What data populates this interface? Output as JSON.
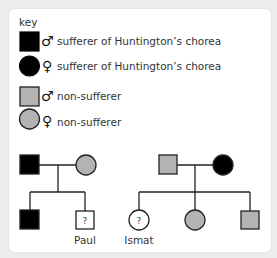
{
  "key": {
    "title": "key",
    "items": [
      {
        "shape": "square",
        "fill": "#000000",
        "sex_symbol": "♂",
        "label": "sufferer of Huntington’s chorea"
      },
      {
        "shape": "circle",
        "fill": "#000000",
        "sex_symbol": "♀",
        "label": "sufferer of Huntington’s chorea"
      },
      {
        "shape": "square",
        "fill": "#b3b3b3",
        "sex_symbol": "♂",
        "label": "non-sufferer"
      },
      {
        "shape": "circle",
        "fill": "#b3b3b3",
        "sex_symbol": "♀",
        "label": "non-sufferer"
      }
    ]
  },
  "colors": {
    "sufferer": "#000000",
    "non_sufferer": "#b3b3b3",
    "unknown": "#ffffff",
    "stroke": "#222222"
  },
  "families": [
    {
      "parents": {
        "father": {
          "status": "sufferer"
        },
        "mother": {
          "status": "non-sufferer"
        }
      },
      "children": [
        {
          "sex": "male",
          "status": "sufferer",
          "name": ""
        },
        {
          "sex": "male",
          "status": "unknown",
          "mark": "?",
          "name": "Paul"
        }
      ]
    },
    {
      "parents": {
        "father": {
          "status": "non-sufferer"
        },
        "mother": {
          "status": "sufferer"
        }
      },
      "children": [
        {
          "sex": "female",
          "status": "unknown",
          "mark": "?",
          "name": "Ismat"
        },
        {
          "sex": "female",
          "status": "non-sufferer",
          "name": ""
        },
        {
          "sex": "male",
          "status": "non-sufferer",
          "name": ""
        }
      ]
    }
  ]
}
